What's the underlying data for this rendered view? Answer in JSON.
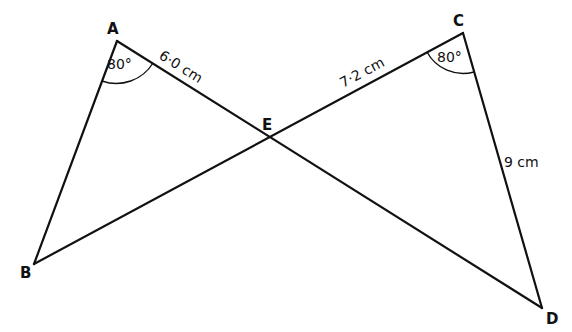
{
  "diagram": {
    "type": "geometry",
    "vertices": {
      "A": {
        "label": "A",
        "x": 117,
        "y": 41
      },
      "B": {
        "label": "B",
        "x": 34,
        "y": 264
      },
      "C": {
        "label": "C",
        "x": 463,
        "y": 33
      },
      "D": {
        "label": "D",
        "x": 542,
        "y": 308
      },
      "E": {
        "label": "E",
        "x": 270,
        "y": 137
      }
    },
    "segments": [
      {
        "from": "A",
        "to": "B"
      },
      {
        "from": "A",
        "to": "D"
      },
      {
        "from": "B",
        "to": "C"
      },
      {
        "from": "C",
        "to": "D"
      }
    ],
    "measurements": {
      "AE": "6·0 cm",
      "CE": "7·2 cm",
      "CD": "9 cm"
    },
    "angles": {
      "A": "80°",
      "C": "80°"
    }
  }
}
